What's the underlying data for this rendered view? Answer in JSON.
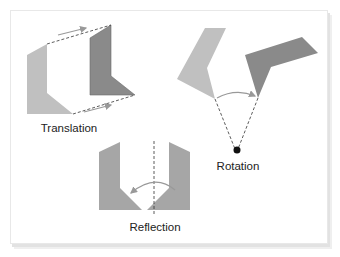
{
  "diagram": {
    "labels": {
      "translation": "Translation",
      "rotation": "Rotation",
      "reflection": "Reflection"
    },
    "colors": {
      "light_shape": "#c0c0c0",
      "dark_shape": "#8a8a8a",
      "medium_shape": "#a6a6a6",
      "arrow": "#999999",
      "dashed_line": "#333333",
      "pivot_point": "#111111",
      "frame_border": "#e8e8e8"
    }
  }
}
